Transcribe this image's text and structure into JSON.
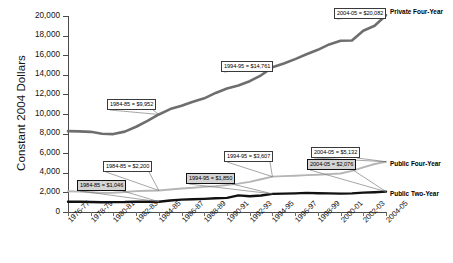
{
  "chart_data": {
    "type": "line",
    "title": "",
    "xlabel": "",
    "ylabel": "Constant 2004 Dollars",
    "ylim": [
      0,
      20000
    ],
    "ytick_values": [
      0,
      2000,
      4000,
      6000,
      8000,
      10000,
      12000,
      14000,
      16000,
      18000,
      20000
    ],
    "ytick_labels": [
      "0",
      "2,000",
      "4,000",
      "6,000",
      "8,000",
      "10,000",
      "12,000",
      "14,000",
      "16,000",
      "18,000",
      "20,000"
    ],
    "grid": false,
    "legend_position": "line-end-labels",
    "categories": [
      "1976-77",
      "1977-78",
      "1978-79",
      "1979-80",
      "1980-81",
      "1981-82",
      "1982-83",
      "1983-84",
      "1984-85",
      "1985-86",
      "1986-87",
      "1987-88",
      "1988-89",
      "1989-90",
      "1990-91",
      "1991-92",
      "1992-93",
      "1993-94",
      "1994-95",
      "1995-96",
      "1996-97",
      "1997-98",
      "1998-99",
      "1999-00",
      "2000-01",
      "2001-02",
      "2002-03",
      "2003-04",
      "2004-05"
    ],
    "xtick_labels": [
      "1976-77",
      "1978-79",
      "1980-81",
      "1982-83",
      "1984-85",
      "1986-87",
      "1988-89",
      "1990-91",
      "1992-93",
      "1994-95",
      "1996-97",
      "1998-99",
      "2000-01",
      "2002-03",
      "2004-05"
    ],
    "series": [
      {
        "name": "Private Four-Year",
        "color": "#6e6e6e",
        "values": [
          8250,
          8230,
          8180,
          7990,
          7950,
          8200,
          8700,
          9300,
          9952,
          10500,
          10850,
          11250,
          11600,
          12150,
          12600,
          12900,
          13350,
          13950,
          14761,
          15150,
          15600,
          16100,
          16550,
          17100,
          17480,
          17500,
          18500,
          19000,
          20082
        ]
      },
      {
        "name": "Public Four-Year",
        "color": "#b5b5b5",
        "values": [
          2120,
          2080,
          2010,
          1950,
          1960,
          2040,
          2130,
          2170,
          2200,
          2290,
          2400,
          2480,
          2560,
          2640,
          2760,
          2900,
          3080,
          3340,
          3607,
          3660,
          3700,
          3760,
          3800,
          3860,
          3930,
          4200,
          4550,
          4900,
          5132
        ]
      },
      {
        "name": "Public Two-Year",
        "color": "#111111",
        "values": [
          1050,
          1040,
          1020,
          1000,
          1010,
          1020,
          1060,
          1040,
          1046,
          1180,
          1260,
          1300,
          1340,
          1400,
          1440,
          1700,
          1600,
          1680,
          1850,
          1870,
          1900,
          1950,
          1920,
          1900,
          1880,
          1900,
          1980,
          2020,
          2076
        ]
      }
    ],
    "annotations": [
      {
        "text": "2004-05 = $20,082",
        "series": "Private Four-Year",
        "category": "2004-05",
        "value": 20082,
        "style": "light"
      },
      {
        "text": "1994-95 = $14,761",
        "series": "Private Four-Year",
        "category": "1994-95",
        "value": 14761,
        "style": "light"
      },
      {
        "text": "1984-85 = $9,952",
        "series": "Private Four-Year",
        "category": "1984-85",
        "value": 9952,
        "style": "light"
      },
      {
        "text": "2004-05 = $5,132",
        "series": "Public Four-Year",
        "category": "2004-05",
        "value": 5132,
        "style": "light"
      },
      {
        "text": "1994-95 = $3,607",
        "series": "Public Four-Year",
        "category": "1994-95",
        "value": 3607,
        "style": "light"
      },
      {
        "text": "1984-85 = $2,200",
        "series": "Public Four-Year",
        "category": "1984-85",
        "value": 2200,
        "style": "light"
      },
      {
        "text": "2004-05 = $2,076",
        "series": "Public Two-Year",
        "category": "2004-05",
        "value": 2076,
        "style": "dark"
      },
      {
        "text": "1994-95 = $1,850",
        "series": "Public Two-Year",
        "category": "1994-95",
        "value": 1850,
        "style": "dark"
      },
      {
        "text": "1984-85 = $1,046",
        "series": "Public Two-Year",
        "category": "1984-85",
        "value": 1046,
        "style": "dark"
      }
    ]
  }
}
